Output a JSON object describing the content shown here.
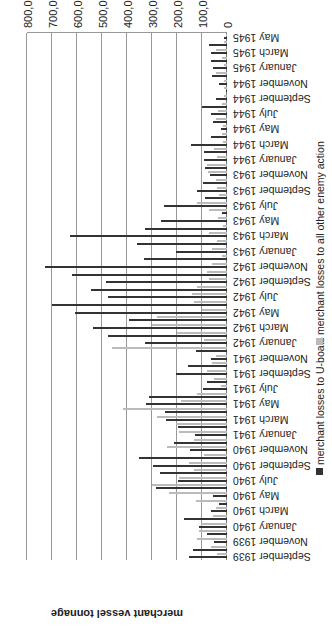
{
  "chart_data": {
    "type": "bar",
    "orientation": "horizontal",
    "rotation_deg": 180,
    "title": "",
    "xlabel": "",
    "ylabel": "merchant vessel tonnage",
    "ylim": [
      0,
      800000
    ],
    "ticks": [
      "0",
      "100,000",
      "200,000",
      "300,000",
      "400,000",
      "500,000",
      "600,000",
      "700,000",
      "800,000"
    ],
    "legend": [
      "merchant losses to U-boats",
      "merchant losses to all other enemy action"
    ],
    "colors": {
      "uboats": "#333333",
      "other": "#bbbbbb"
    },
    "grid": true,
    "categories": [
      "September 1939",
      "October 1939",
      "November 1939",
      "December 1939",
      "January 1940",
      "February 1940",
      "March 1940",
      "April 1940",
      "May 1940",
      "June 1940",
      "July 1940",
      "August 1940",
      "September 1940",
      "October 1940",
      "November 1940",
      "December 1940",
      "January 1941",
      "February 1941",
      "March 1941",
      "April 1941",
      "May 1941",
      "June 1941",
      "July 1941",
      "August 1941",
      "September 1941",
      "October 1941",
      "November 1941",
      "December 1941",
      "January 1942",
      "February 1942",
      "March 1942",
      "April 1942",
      "May 1942",
      "June 1942",
      "July 1942",
      "August 1942",
      "September 1942",
      "October 1942",
      "November 1942",
      "December 1942",
      "January 1943",
      "February 1943",
      "March 1943",
      "April 1943",
      "May 1943",
      "June 1943",
      "July 1943",
      "August 1943",
      "September 1943",
      "October 1943",
      "November 1943",
      "December 1943",
      "January 1944",
      "February 1944",
      "March 1944",
      "April 1944",
      "May 1944",
      "June 1944",
      "July 1944",
      "August 1944",
      "September 1944",
      "October 1944",
      "November 1944",
      "December 1944",
      "January 1945",
      "February 1945",
      "March 1945",
      "April 1945",
      "May 1945"
    ],
    "tick_labels_shown": [
      "September 1939",
      "November 1939",
      "January 1940",
      "March 1940",
      "May 1940",
      "July 1940",
      "September 1940",
      "November 1940",
      "January 1941",
      "March 1941",
      "May 1941",
      "July 1941",
      "September 1941",
      "November 1941",
      "January 1942",
      "March 1942",
      "May 1942",
      "July 1942",
      "September 1942",
      "November 1942",
      "January 1943",
      "March 1943",
      "May 1943",
      "July 1943",
      "September 1943",
      "November 1943",
      "January 1944",
      "March 1944",
      "May 1944",
      "July 1944",
      "September 1944",
      "November 1944",
      "January 1945",
      "March 1945",
      "May 1945"
    ],
    "series": [
      {
        "name": "merchant losses to U-boats",
        "values": [
          153000,
          134000,
          51000,
          81000,
          111000,
          170000,
          62000,
          32000,
          55000,
          284000,
          196000,
          268000,
          295000,
          352000,
          146000,
          212000,
          127000,
          197000,
          243000,
          249000,
          325000,
          311000,
          95000,
          80000,
          203000,
          156000,
          62000,
          125000,
          327000,
          476000,
          537000,
          391000,
          607000,
          700000,
          476000,
          544000,
          485000,
          619000,
          729000,
          330000,
          203000,
          360000,
          627000,
          328000,
          265000,
          21000,
          252000,
          86000,
          119000,
          97000,
          67000,
          87000,
          92000,
          93000,
          142000,
          62000,
          24000,
          57000,
          63000,
          99000,
          43000,
          1000,
          30000,
          58000,
          56000,
          65000,
          65000,
          73000,
          10000
        ]
      },
      {
        "name": "merchant losses to all other enemy action",
        "values": [
          40000,
          62000,
          120000,
          110000,
          103000,
          56000,
          45000,
          125000,
          230000,
          300000,
          190000,
          130000,
          150000,
          90000,
          240000,
          130000,
          190000,
          205000,
          280000,
          415000,
          185000,
          120000,
          25000,
          50000,
          80000,
          60000,
          42000,
          460000,
          90000,
          200000,
          300000,
          280000,
          100000,
          130000,
          140000,
          120000,
          70000,
          80000,
          60000,
          20000,
          60000,
          40000,
          70000,
          15000,
          35000,
          70000,
          120000,
          30000,
          38000,
          45000,
          75000,
          80000,
          40000,
          50000,
          15000,
          20000,
          15000,
          45000,
          35000,
          20000,
          10000,
          10000,
          10000,
          45000,
          10000,
          20000,
          45000,
          10000,
          5000
        ]
      }
    ]
  }
}
